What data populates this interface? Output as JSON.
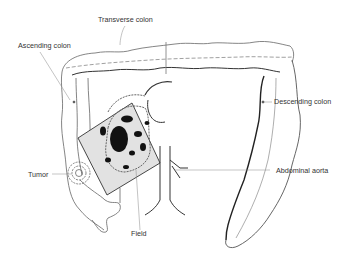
{
  "diagram": {
    "labels": {
      "transverse_colon": "Transverse colon",
      "ascending_colon": "Ascending colon",
      "descending_colon": "Descending colon",
      "tumor": "Tumor",
      "abdominal_aorta": "Abdominal aorta",
      "field": "Field"
    },
    "colors": {
      "line": "#555555",
      "dark_fill": "#111111",
      "field_fill": "#e2e2e2",
      "leader": "#888888"
    }
  }
}
